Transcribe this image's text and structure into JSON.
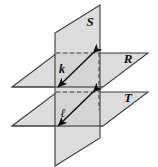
{
  "figure": {
    "background_color": "#ffffff",
    "width": 158,
    "height": 167,
    "planes": [
      {
        "id": "S",
        "label": "S",
        "orientation": "vertical",
        "fill": "#d4d4d4",
        "stroke": "#3a3a3a",
        "label_x": 90,
        "label_y": 26
      },
      {
        "id": "R",
        "label": "R",
        "orientation": "horizontal-upper",
        "fill": "#d9d9d9",
        "stroke": "#3a3a3a",
        "label_x": 128,
        "label_y": 62
      },
      {
        "id": "T",
        "label": "T",
        "orientation": "horizontal-lower",
        "fill": "#d9d9d9",
        "stroke": "#3a3a3a",
        "label_x": 128,
        "label_y": 101
      }
    ],
    "lines": [
      {
        "id": "k",
        "label": "k",
        "description": "intersection line of plane S and plane R",
        "label_x": 62,
        "label_y": 73,
        "stroke": "#111111",
        "arrows": "double"
      },
      {
        "id": "l",
        "label": "ℓ",
        "description": "intersection line of plane S and plane T",
        "label_x": 63,
        "label_y": 118,
        "stroke": "#111111",
        "arrows": "double"
      }
    ],
    "hidden_edges": {
      "style": "dashed",
      "stroke": "#4a4a4a",
      "description": "hidden intersection edges behind plane S"
    }
  }
}
